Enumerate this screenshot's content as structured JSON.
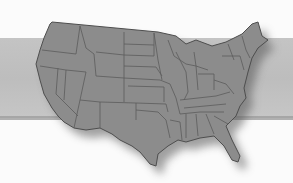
{
  "image": {
    "subject": "us-map",
    "description": "Grayscale map of the contiguous United States with state borders, drop shadow, over a horizontal gray band",
    "colors": {
      "background": "#fbfbfb",
      "band": "#c2c2c2",
      "map_fill": "#8c8c8c",
      "state_borders": "#5a5a5a",
      "shadow": "#6e6e6e"
    }
  }
}
